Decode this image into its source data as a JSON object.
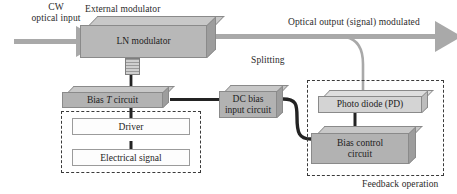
{
  "figure": {
    "type": "block-diagram"
  },
  "labels": {
    "cw_input_line1": "CW",
    "cw_input_line2": "optical input",
    "external_modulator": "External modulator",
    "optical_output": "Optical output (signal) modulated",
    "splitting": "Splitting",
    "feedback_operation": "Feedback operation"
  },
  "blocks": {
    "ln_modulator": {
      "label": "LN modulator",
      "style": "shaded-3d"
    },
    "bias_t": {
      "label_pre": "Bias ",
      "label_italic": "T",
      "label_post": " circuit",
      "style": "shaded-3d"
    },
    "dc_bias": {
      "line1": "DC bias",
      "line2": "input circuit",
      "style": "shaded-3d"
    },
    "photo_diode": {
      "label": "Photo diode (PD)",
      "style": "shaded-3d-light"
    },
    "bias_control": {
      "line1": "Bias control",
      "line2": "circuit",
      "style": "shaded-3d"
    },
    "driver": {
      "label": "Driver",
      "style": "flat-white"
    },
    "electrical_signal": {
      "label": "Electrical signal",
      "style": "flat-white"
    }
  },
  "colors": {
    "box_fill_dark": "#b2b2b2",
    "box_fill_light": "#d0d0d0",
    "box_top_face": "#c8c8c8",
    "box_side_face": "#9d9d9d",
    "box_outline": "#8a8a8a",
    "wire_dark": "#232323",
    "dashed_border": "#3a3a3a",
    "optical_beam": "#a9a9a9",
    "text": "#1d1d1d",
    "background": "#ffffff"
  }
}
